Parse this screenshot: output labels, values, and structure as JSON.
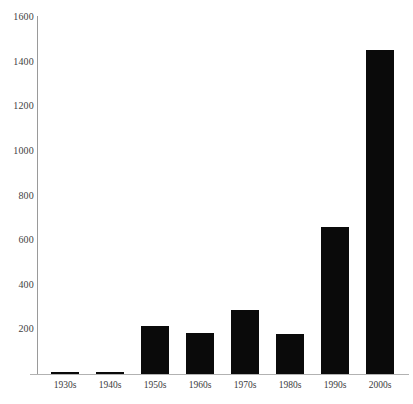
{
  "chart_data": {
    "type": "bar",
    "title": "",
    "subtitle": "",
    "xlabel": "",
    "ylabel": "",
    "categories": [
      "1930s",
      "1940s",
      "1950s",
      "1960s",
      "1970s",
      "1980s",
      "1990s",
      "2000s"
    ],
    "values": [
      8,
      8,
      215,
      185,
      285,
      178,
      660,
      1450
    ],
    "series": [
      {
        "name": "Count by decade",
        "values": [
          8,
          8,
          215,
          185,
          285,
          178,
          660,
          1450
        ]
      }
    ],
    "ylim": [
      0,
      1600
    ],
    "y_ticks": [
      200,
      400,
      600,
      800,
      1000,
      1200,
      1400,
      1600
    ],
    "y_tick_labels": [
      "200",
      "400",
      "600",
      "800",
      "1000",
      "1200",
      "1400",
      "1600"
    ],
    "x_tick_labels": [
      "1930s",
      "1940s",
      "1950s",
      "1960s",
      "1970s",
      "1980s",
      "1990s",
      "2000s"
    ],
    "grid": false,
    "legend": false,
    "legend_position": "none",
    "bar_color": "#0a0a0a",
    "axis_color": "#9a9a9a",
    "background_color": "#ffffff",
    "text_color": "#3a3a3a",
    "annotations": []
  }
}
